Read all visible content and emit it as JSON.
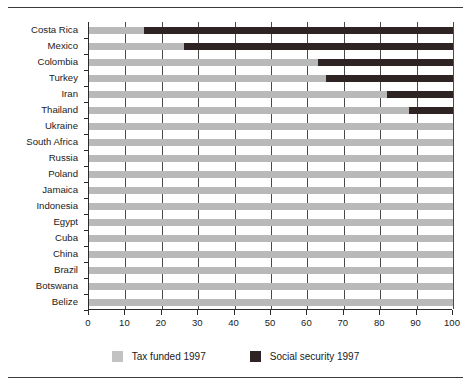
{
  "chart_data": {
    "type": "bar",
    "orientation": "horizontal",
    "stacked": true,
    "title": "",
    "subtitle": "",
    "xlabel": "",
    "ylabel": "",
    "xlim": [
      0,
      100
    ],
    "xticks": [
      0,
      10,
      20,
      30,
      40,
      50,
      60,
      70,
      80,
      90,
      100
    ],
    "xticklabels": [
      "0",
      "10",
      "20",
      "30",
      "40",
      "50",
      "60",
      "70",
      "80",
      "90",
      "100"
    ],
    "grid": "vertical",
    "legend_position": "bottom-center",
    "categories": [
      "Costa Rica",
      "Mexico",
      "Colombia",
      "Turkey",
      "Iran",
      "Thailand",
      "Ukraine",
      "South Africa",
      "Russia",
      "Poland",
      "Jamaica",
      "Indonesia",
      "Egypt",
      "Cuba",
      "China",
      "Brazil",
      "Botswana",
      "Belize"
    ],
    "series": [
      {
        "name": "Tax funded 1997",
        "color": "#b9b9b9",
        "values": [
          15,
          26,
          63,
          65,
          82,
          88,
          100,
          100,
          100,
          100,
          100,
          100,
          100,
          100,
          100,
          100,
          100,
          100
        ]
      },
      {
        "name": "Social security 1997",
        "color": "#2e2424",
        "values": [
          85,
          74,
          37,
          35,
          18,
          12,
          0,
          0,
          0,
          0,
          0,
          0,
          0,
          0,
          0,
          0,
          0,
          0
        ]
      }
    ]
  },
  "legend": {
    "items": [
      {
        "label": "Tax funded 1997",
        "swatch": "tax"
      },
      {
        "label": "Social security 1997",
        "swatch": "soc"
      }
    ]
  },
  "colors": {
    "tax_funded": "#b9b9b9",
    "social_security": "#2e2424",
    "axis": "#2b2b2b",
    "gridline": "#4a4a4a",
    "text": "#1a1a1a",
    "background": "#ffffff"
  }
}
